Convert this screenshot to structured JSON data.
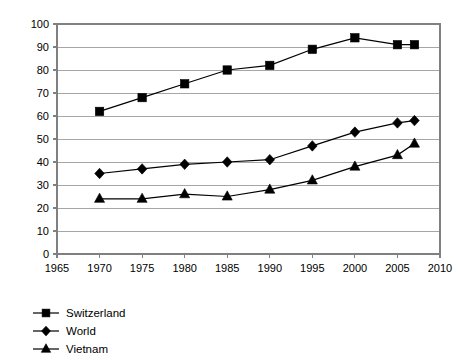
{
  "chart_data": {
    "type": "line",
    "title": "",
    "subtitle": "",
    "xlabel": "",
    "ylabel": "",
    "xlim": [
      1965,
      2010
    ],
    "ylim": [
      0,
      100
    ],
    "grid": true,
    "grid_axis": "y",
    "legend_position": "bottom-left",
    "x_ticks": [
      1965,
      1970,
      1975,
      1980,
      1985,
      1990,
      1995,
      2000,
      2005,
      2010
    ],
    "y_ticks": [
      0,
      10,
      20,
      30,
      40,
      50,
      60,
      70,
      80,
      90,
      100
    ],
    "x": [
      1970,
      1975,
      1980,
      1985,
      1990,
      1995,
      2000,
      2005,
      2007
    ],
    "series": [
      {
        "name": "Switzerland",
        "marker": "square",
        "color": "#000000",
        "values": [
          62,
          68,
          74,
          80,
          82,
          89,
          94,
          91,
          91
        ]
      },
      {
        "name": "World",
        "marker": "diamond",
        "color": "#000000",
        "values": [
          35,
          37,
          39,
          40,
          41,
          47,
          53,
          57,
          58
        ]
      },
      {
        "name": "Vietnam",
        "marker": "triangle",
        "color": "#000000",
        "values": [
          24,
          24,
          26,
          25,
          28,
          32,
          38,
          43,
          48
        ]
      }
    ]
  },
  "legend": {
    "items": [
      {
        "label": "Switzerland",
        "marker": "square"
      },
      {
        "label": "World",
        "marker": "diamond"
      },
      {
        "label": "Vietnam",
        "marker": "triangle"
      }
    ]
  },
  "axes": {
    "y_labels": [
      "100",
      "90",
      "80",
      "70",
      "60",
      "50",
      "40",
      "30",
      "20",
      "10",
      "0"
    ],
    "x_labels": [
      "1965",
      "1970",
      "1975",
      "1980",
      "1985",
      "1990",
      "1995",
      "2000",
      "2005",
      "2010"
    ]
  }
}
